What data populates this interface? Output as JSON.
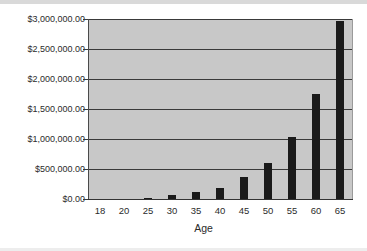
{
  "chart_data": {
    "type": "bar",
    "title": "",
    "xlabel": "Age",
    "ylabel": "",
    "categories": [
      "18",
      "20",
      "25",
      "30",
      "35",
      "40",
      "45",
      "50",
      "55",
      "60",
      "65"
    ],
    "values": [
      0,
      0,
      25000,
      60000,
      110000,
      190000,
      360000,
      600000,
      1040000,
      1750000,
      2970000
    ],
    "ylim": [
      0,
      3000000
    ],
    "ytick_values": [
      0,
      500000,
      1000000,
      1500000,
      2000000,
      2500000,
      3000000
    ],
    "ytick_labels": [
      "$0.00",
      "$500,000.00",
      "$1,000,000.00",
      "$1,500,000.00",
      "$2,000,000.00",
      "$2,500,000.00",
      "$3,000,000.00"
    ],
    "grid": true,
    "legend": false,
    "series": [
      {
        "name": "",
        "values": [
          0,
          0,
          25000,
          60000,
          110000,
          190000,
          360000,
          600000,
          1040000,
          1750000,
          2970000
        ]
      }
    ],
    "colors": {
      "bar": "#1a1a1a",
      "plot_background": "#c8c8c8",
      "gridline": "#3a3a3a",
      "page_background": "#ffffff",
      "text": "#2b2b2b"
    }
  }
}
